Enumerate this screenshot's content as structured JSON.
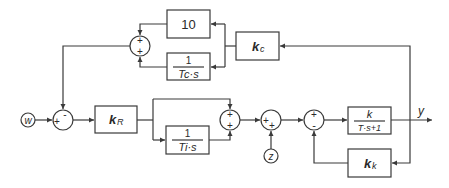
{
  "diagram": {
    "type": "control-loop-block-diagram",
    "colors": {
      "stroke": "#3a3a3a",
      "text": "#2a2a2a",
      "background": "#ffffff"
    },
    "inputs": {
      "setpoint": "w",
      "disturbance": "z"
    },
    "output": "y",
    "blocks": {
      "gain_10": {
        "label": "10"
      },
      "tc_integrator": {
        "numerator": "1",
        "denominator": "Tc·s"
      },
      "kc": {
        "label": "k",
        "subscript": "c"
      },
      "kr": {
        "label": "k",
        "subscript": "R"
      },
      "ti_integrator": {
        "numerator": "1",
        "denominator": "Ti·s"
      },
      "plant": {
        "numerator": "k",
        "denominator": "T·s+1"
      },
      "kk": {
        "label": "k",
        "subscript": "k"
      }
    },
    "summing_junctions": {
      "top": {
        "top_sign": "+",
        "bottom_sign": "+"
      },
      "input": {
        "left_sign": "+",
        "top_sign": "-"
      },
      "pi": {
        "top_sign": "+",
        "bottom_sign": "+"
      },
      "disturbance": {
        "left_sign": "+",
        "bottom_sign": "+"
      },
      "inner_loop": {
        "top_sign": "+",
        "bottom_sign": "-"
      }
    }
  }
}
